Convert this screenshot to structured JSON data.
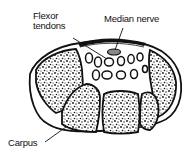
{
  "diagram": {
    "labels": {
      "flexor_line1": "Flexor",
      "flexor_line2": "tendons",
      "median_nerve": "Median nerve",
      "carpus": "Carpus"
    },
    "colors": {
      "stroke": "#111111",
      "background": "#ffffff"
    }
  }
}
